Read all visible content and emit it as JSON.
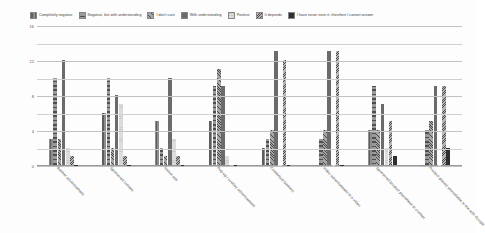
{
  "chart_data": {
    "type": "bar",
    "title": "",
    "xlabel": "",
    "ylabel": "",
    "ylim": [
      0,
      16
    ],
    "yticks": [
      "0",
      "4",
      "8",
      "12",
      "16"
    ],
    "grid": true,
    "legend_position": "top",
    "categories": [
      "Banner advertisement",
      "Sponsored content",
      "Native ads",
      "Pop-up / overlay advertisement",
      "Contextual banners",
      "Video advertisement in a video",
      "Sponsored product placement in content",
      "Product placed unavailable to me with Google"
    ],
    "series": [
      {
        "name": "Completely negative",
        "values": [
          3,
          6,
          5,
          5,
          2,
          0,
          4,
          0
        ]
      },
      {
        "name": "Negative, but with understanding",
        "values": [
          10,
          10,
          2,
          9,
          3,
          3,
          9,
          4
        ]
      },
      {
        "name": "I don't care",
        "values": [
          3,
          2,
          1,
          11,
          4,
          4,
          4,
          5
        ]
      },
      {
        "name": "With understanding",
        "values": [
          12,
          8,
          10,
          9,
          13,
          13,
          7,
          9
        ]
      },
      {
        "name": "Positive",
        "values": [
          2,
          7,
          3,
          1,
          0,
          0,
          2,
          0
        ]
      },
      {
        "name": "It depends",
        "values": [
          1,
          1,
          1,
          0,
          12,
          13,
          5,
          9
        ]
      },
      {
        "name": "I have never seen it, therefore I cannot answer",
        "values": [
          0,
          0,
          0,
          0,
          0,
          0,
          1,
          2
        ]
      }
    ],
    "series_colors": [
      "#8e8e8e",
      "#9a9a9a",
      "#a6a6a6",
      "#6b6b6b",
      "#dcdcdc",
      "#b5b5b5",
      "#2f2f2f"
    ]
  }
}
